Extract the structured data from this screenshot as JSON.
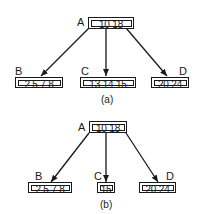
{
  "diagrams": [
    {
      "caption": "(a)",
      "root": {
        "label": "A",
        "keys": "10 18"
      },
      "children": [
        {
          "label": "B",
          "keys": "2 5 7 8"
        },
        {
          "label": "C",
          "keys": "13 14 15"
        },
        {
          "label": "D",
          "keys": "20 24"
        }
      ]
    },
    {
      "caption": "(b)",
      "root": {
        "label": "A",
        "keys": "10 18"
      },
      "children": [
        {
          "label": "B",
          "keys": "2 5 7 8"
        },
        {
          "label": "C",
          "keys": "15"
        },
        {
          "label": "D",
          "keys": "20 24"
        }
      ]
    }
  ],
  "colors": {
    "stroke": "#1a1a1a",
    "background": "#ffffff"
  }
}
